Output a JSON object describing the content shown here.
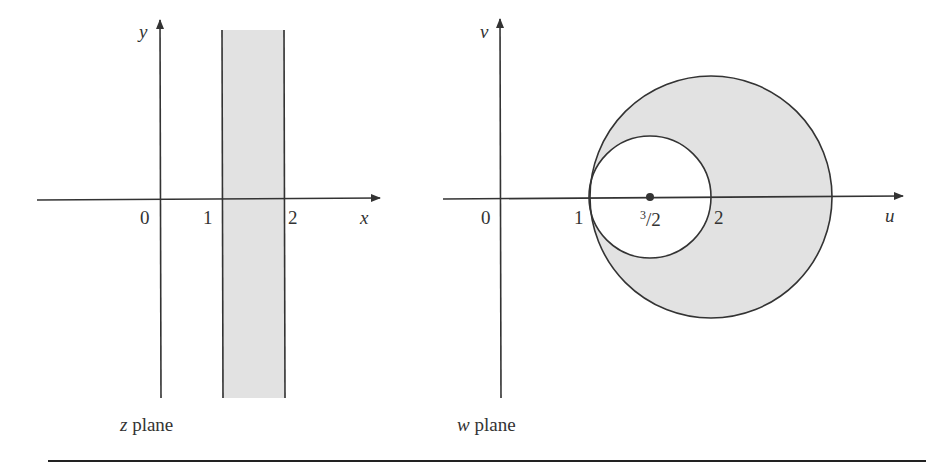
{
  "figure": {
    "left_panel": {
      "caption_var": "z",
      "caption_text": " plane",
      "x_axis_label": "x",
      "y_axis_label": "y",
      "ticks": [
        "0",
        "1",
        "2"
      ],
      "shaded_region": "strip 1 < x < 2"
    },
    "right_panel": {
      "caption_var": "w",
      "caption_text": " plane",
      "x_axis_label": "u",
      "y_axis_label": "v",
      "ticks": [
        "0",
        "1",
        "2"
      ],
      "center_label_num": "3",
      "center_label_den": "/2",
      "shaded_region": "region between outer circle and inner circle tangent at u=1"
    },
    "colors": {
      "line": "#333333",
      "fill": "#e2e2e2",
      "background": "#ffffff"
    }
  }
}
